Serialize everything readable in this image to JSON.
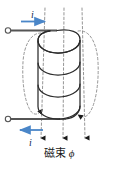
{
  "figure": {
    "type": "physics-diagram",
    "width": 119,
    "height": 173,
    "background_color": "#ffffff"
  },
  "caption": {
    "text": "磁束",
    "symbol": "ϕ",
    "meaning": "magnetic flux phi"
  },
  "current": {
    "symbol": "i",
    "top": {
      "label": "i",
      "arrow_direction": "right",
      "arrow_color": "#4a86c8"
    },
    "bottom": {
      "label": "i",
      "arrow_direction": "left",
      "arrow_color": "#4a86c8"
    }
  },
  "coil": {
    "turns": 4,
    "stroke_color": "#2b2b2b",
    "lead_color": "#555555",
    "terminal_shape": "open-circle",
    "terminals": [
      {
        "name": "top-terminal",
        "x": 8,
        "y": 30
      },
      {
        "name": "bottom-terminal",
        "x": 8,
        "y": 119
      }
    ]
  },
  "flux_lines": {
    "style": "dashed",
    "color": "#7a7a7a",
    "arrowhead_color": "#1a1a1a",
    "interior_lines": 3,
    "exterior_loops": 2,
    "direction": "downward-through-coil"
  },
  "colors": {
    "ink": "#2b2b2b",
    "accent_blue": "#4a86c8",
    "dash_gray": "#7a7a7a"
  }
}
